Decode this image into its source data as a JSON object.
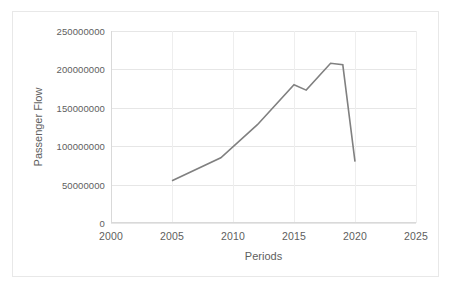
{
  "chart_data": {
    "type": "line",
    "title": "",
    "xlabel": "Periods",
    "ylabel": "Passenger Flow",
    "xlim": [
      2000,
      2025
    ],
    "ylim": [
      0,
      250000000
    ],
    "grid": true,
    "legend": "none",
    "line_color": "#808080",
    "x": [
      2005,
      2009,
      2012,
      2015,
      2016,
      2018,
      2019,
      2020
    ],
    "values": [
      55000000,
      85000000,
      128000000,
      180000000,
      173000000,
      208000000,
      206000000,
      80000000
    ],
    "series": [
      {
        "name": "Passenger Flow",
        "x": [
          2005,
          2009,
          2012,
          2015,
          2016,
          2018,
          2019,
          2020
        ],
        "values": [
          55000000,
          85000000,
          128000000,
          180000000,
          173000000,
          208000000,
          206000000,
          80000000
        ]
      }
    ],
    "xticks": [
      2000,
      2005,
      2010,
      2015,
      2020,
      2025
    ],
    "xtick_labels": [
      "2000",
      "2005",
      "2010",
      "2015",
      "2020",
      "2025"
    ],
    "yticks": [
      0,
      50000000,
      100000000,
      150000000,
      200000000,
      250000000
    ],
    "ytick_labels": [
      "0",
      "50000000",
      "100000000",
      "150000000",
      "200000000",
      "250000000"
    ]
  },
  "colors": {
    "line": "#808080",
    "gridline": "#e6e6e6",
    "axis": "#d9d9d9",
    "text": "#5e5e5e",
    "frame_border": "#e8e8e8",
    "background": "#ffffff"
  }
}
